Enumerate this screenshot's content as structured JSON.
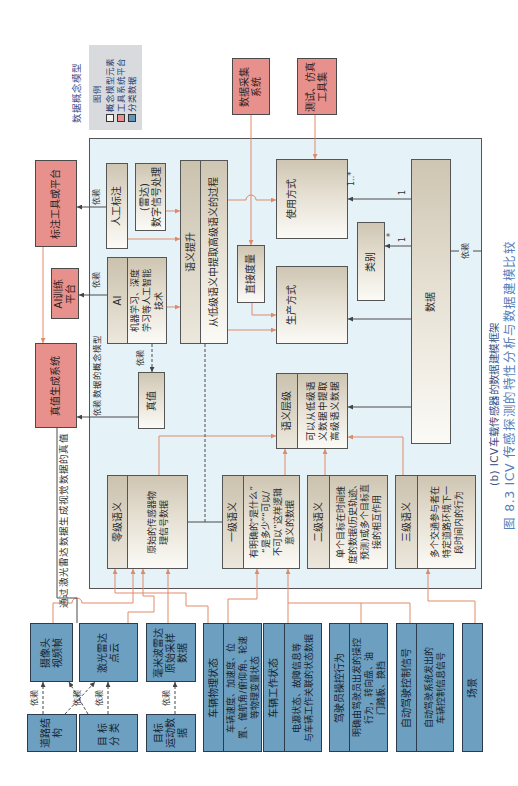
{
  "header": {
    "title": "数据概念模型"
  },
  "legend": {
    "heading": "图例",
    "items": [
      {
        "label": "概念模型元素",
        "swatch": "#f6f3ec"
      },
      {
        "label": "工具系统平台",
        "swatch": "#e8908c"
      },
      {
        "label": "分类数据",
        "swatch": "#5f97bb"
      }
    ]
  },
  "tools": {
    "data_collection": "数据采集\n系统",
    "test_simulation": "测试、仿真\n工具集",
    "annotation_platform": "标注工具或平台",
    "ai_training_platform": "AI训练\n平台",
    "ground_truth_system": "真值生成系统"
  },
  "model": {
    "label": "数据的概念模型",
    "manual_annotation": "人工标注",
    "radar_dsp": "(雷达)\n数字信号处理",
    "semantic_lift": {
      "header": "语义提升",
      "body": "从低级语义中提取高级语义的过程"
    },
    "ai": {
      "header": "AI",
      "body": "机器学习、深度\n学习等人工智能\n技术"
    },
    "ground_truth": "真值",
    "direct_measure": "直接度量",
    "usage_mode": "使用方式",
    "production_mode": "生产方式",
    "category": "类别",
    "data": "数据",
    "semantic_level": {
      "header": "语义层级",
      "body": "可以从低级语\n义数据中提取\n高级语义数据"
    },
    "levels": [
      {
        "header": "零级语义",
        "body": "原始的传感器物\n理信号数据"
      },
      {
        "header": "一级语义",
        "body": "有明确的“是什么”\n“是多少”“可以/\n不可以”这样逻辑\n意义的数据"
      },
      {
        "header": "二级语义",
        "body": "单个目标在时间维\n度的数据(历史轨迹、\n预测)或多个目标直\n接的相互作用"
      },
      {
        "header": "三级语义",
        "body": "多个交通参与者在\n特定道路环境下一\n段时间内的行为"
      }
    ]
  },
  "classified_data": {
    "sensors": [
      "摄像头\n视频帧",
      "激光雷达\n点云",
      "毫米波雷达\n原始采样\n数据"
    ],
    "perception": [
      "道路结构",
      "目标分类",
      "目标\n运动数据"
    ],
    "vehicle_signals": [
      {
        "header": "车辆物理状态",
        "body": "车辆速度、加速度、位\n置、偏航角/俯仰角、轮速\n等物理变量状态"
      },
      {
        "header": "车辆工作状态",
        "body": "电源状态、故障信息等\n与车辆工作关联的状态数据"
      },
      {
        "header": "驾驶员操控行为",
        "body": "明确由驾驶员出发的操控\n行为，转向盘、油\n门踏板、换挡"
      },
      {
        "header": "自动驾驶控制信号",
        "body": "自动驾驶系统发出的\n车辆控制信息信号"
      }
    ],
    "scene": "场景"
  },
  "relations": {
    "depends": "依赖",
    "lidar_truth_note": "通过激光雷达数据生成视觉数据的真值",
    "data_usage_source": "1",
    "data_usage_target": "1..*",
    "data_category_source": "1",
    "data_category_target": "*"
  },
  "captions": {
    "subfigure": "(b) ICV车载传感器的数据建模框架",
    "figure": "图 8.3  ICV 传感探测的特性分析与数据建模比较"
  },
  "colors": {
    "tool_platform": "#e8908c",
    "classified_data": "#6c9fc0",
    "concept_element": "#f6f3ec",
    "model_background": "#e5f2f8",
    "flow_line": "#e08b68",
    "relation_line": "#4a4a4a",
    "caption": "#5a7fb8"
  }
}
